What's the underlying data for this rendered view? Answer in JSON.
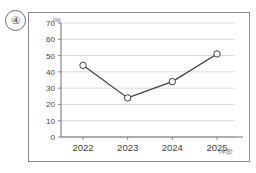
{
  "item_label": "④",
  "chart_data": {
    "type": "line",
    "title": "",
    "subtitle": "",
    "xlabel": "(年度)",
    "ylabel": "(%)",
    "categories": [
      "2022",
      "2023",
      "2024",
      "2025"
    ],
    "values": [
      44,
      24,
      34,
      51
    ],
    "series": [
      {
        "name": "",
        "values": [
          44,
          24,
          34,
          51
        ]
      }
    ],
    "ylim": [
      0,
      70
    ],
    "yticks": [
      "0",
      "10",
      "20",
      "30",
      "40",
      "50",
      "60",
      "70"
    ],
    "ytick_values": [
      0,
      10,
      20,
      30,
      40,
      50,
      60,
      70
    ],
    "xticks": [
      "2022",
      "2023",
      "2024",
      "2025"
    ],
    "grid": true,
    "grid_axis": "y",
    "legend": false,
    "legend_position": "none",
    "marker": "open-circle",
    "line_color": "#3c3c3c",
    "marker_fill": "#ffffff",
    "marker_edge": "#3c3c3c",
    "grid_color": "#c8c8c8",
    "axis_color": "#6e6e6e",
    "frame_color": "#8d8d8d",
    "annotations": []
  }
}
